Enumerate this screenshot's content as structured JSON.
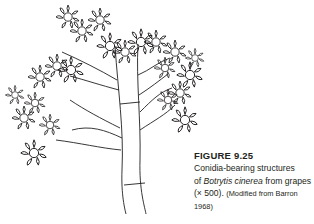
{
  "figure": {
    "label": "FIGURE 9.25",
    "caption_line1": "Conidia-bearing structures",
    "caption_line2_prefix": "of ",
    "caption_line2_italic": "Botrytis cinerea",
    "caption_line2_suffix": " from grapes",
    "caption_line3_prefix": "(× 500). ",
    "caption_line3_suffix": "(Modified from Barron",
    "caption_line4": "1968)",
    "illustration": "conidiophore-line-drawing",
    "line_color": "#231f20"
  }
}
